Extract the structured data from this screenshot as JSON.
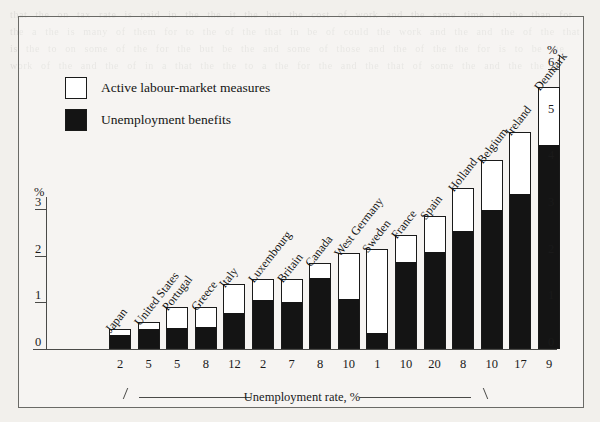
{
  "legend": {
    "items": [
      {
        "label": "Active labour-market measures",
        "swatch": "white-square-icon",
        "color": "#ffffff"
      },
      {
        "label": "Unemployment benefits",
        "swatch": "black-square-icon",
        "color": "#141414"
      }
    ]
  },
  "axes": {
    "left_unit": "%",
    "right_unit": "%",
    "left_ticks": [
      "0",
      "1",
      "2",
      "3"
    ],
    "right_ticks": [
      "0",
      "1",
      "2",
      "3",
      "4",
      "5",
      "6"
    ],
    "x_caption": "Unemployment rate, %"
  },
  "chart_data": {
    "type": "bar",
    "title": "",
    "subtitle": "",
    "xlabel": "Unemployment rate, %",
    "ylabel": "%",
    "ylim": [
      0,
      6
    ],
    "grid": false,
    "stacked": true,
    "legend_position": "top-left",
    "categories": [
      "Japan",
      "United States",
      "Portugal",
      "Greece",
      "Italy",
      "Luxembourg",
      "Britain",
      "Canada",
      "West Germany",
      "Sweden",
      "France",
      "Spain",
      "Holland",
      "Belgium",
      "Ireland",
      "Denmark"
    ],
    "unemployment_rate": [
      2,
      5,
      5,
      8,
      12,
      2,
      7,
      8,
      10,
      1,
      10,
      20,
      8,
      10,
      17,
      9
    ],
    "series": [
      {
        "name": "Unemployment benefits",
        "color": "#141414",
        "values": [
          0.28,
          0.4,
          0.42,
          0.45,
          0.75,
          1.02,
          0.98,
          1.5,
          1.05,
          0.32,
          1.85,
          2.05,
          2.5,
          2.95,
          3.3,
          4.35
        ]
      },
      {
        "name": "Active labour-market measures",
        "color": "#ffffff",
        "values": [
          0.14,
          0.18,
          0.48,
          0.45,
          0.65,
          0.48,
          0.52,
          0.35,
          1.0,
          1.83,
          0.6,
          0.8,
          0.95,
          1.1,
          1.35,
          1.25
        ]
      }
    ],
    "totals": [
      0.42,
      0.58,
      0.9,
      0.9,
      1.4,
      1.5,
      1.5,
      1.85,
      2.05,
      2.15,
      2.45,
      2.85,
      3.45,
      4.05,
      4.65,
      5.6
    ]
  },
  "bleed_text": "that the on tax rate is paid in the the it the but the cost of work and the same time in the than for the a the is many of them for to the of the that in be of could the work and the and the of the that is the to on some of the for the but be the and some of those and the of the the for is to be the work of the and the of in a that the the to a the for the and the that of some the and the the"
}
